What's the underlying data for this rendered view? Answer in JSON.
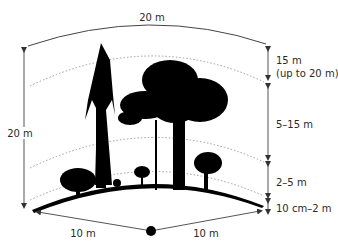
{
  "diagram": {
    "type": "forest-vertical-layers",
    "top_width_label": "20 m",
    "total_height_label": "20 m",
    "left_radius_label": "10 m",
    "right_radius_label": "10 m",
    "layers": [
      {
        "name": "canopy",
        "label_line1": "15 m",
        "label_line2": "(up to 20 m)"
      },
      {
        "name": "subcanopy",
        "label_line1": "5–15 m"
      },
      {
        "name": "shrub",
        "label_line1": "2–5 m"
      },
      {
        "name": "herb",
        "label_line1": "10 cm–2 m"
      }
    ],
    "colors": {
      "silhouette": "#000000",
      "lines": "#555555",
      "dotted": "#888888",
      "text": "#2a2a2a"
    }
  }
}
